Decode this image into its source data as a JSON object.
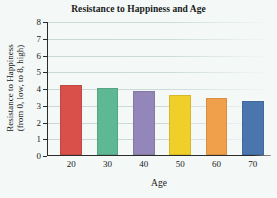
{
  "chart_data": {
    "type": "bar",
    "title": "Resistance to Happiness and Age",
    "xlabel": "Age",
    "ylabel": "Resistance to Happiness (from 0, low, to 8, high)",
    "ylabel_line1": "Resistance to Happiness",
    "ylabel_line2": "(from 0, low, to 8, high)",
    "categories": [
      "20",
      "30",
      "40",
      "50",
      "60",
      "70"
    ],
    "values": [
      4.2,
      4.0,
      3.8,
      3.6,
      3.4,
      3.2
    ],
    "bar_colors": [
      "#d9504a",
      "#5fb894",
      "#9287b8",
      "#f0cf2a",
      "#f0a04a",
      "#4a75ad"
    ],
    "ylim": [
      0,
      8
    ],
    "yticks": [
      "0",
      "1",
      "2",
      "3",
      "4",
      "5",
      "6",
      "7",
      "8"
    ],
    "ytick_values": [
      0,
      1,
      2,
      3,
      4,
      5,
      6,
      7,
      8
    ],
    "grid": true,
    "legend": false,
    "background_color": "#f4f8f7",
    "axis_color": "#2b2b2b",
    "gridline_color": "#ccdbd9"
  }
}
